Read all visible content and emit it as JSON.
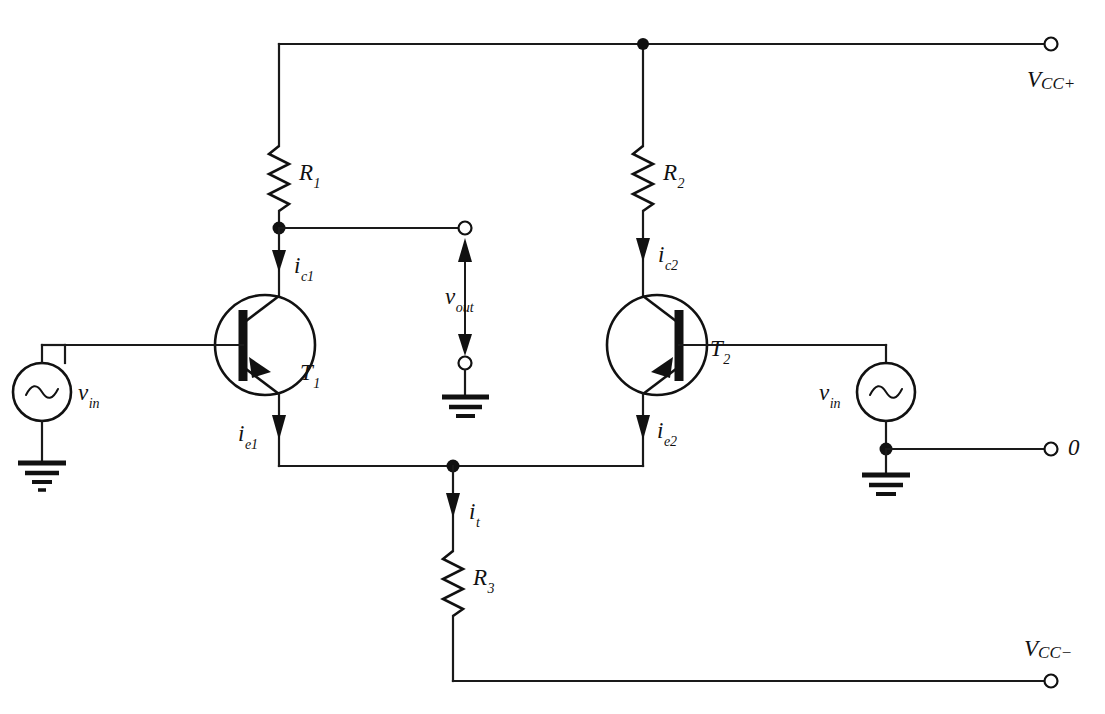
{
  "figure": {
    "type": "schematic",
    "background_color": "#ffffff",
    "line_color": "#111111"
  },
  "labels": {
    "r1": {
      "symbol": "R",
      "subscript": "1"
    },
    "r2": {
      "symbol": "R",
      "subscript": "2"
    },
    "r3": {
      "symbol": "R",
      "subscript": "3"
    },
    "t1": {
      "symbol": "T",
      "subscript": "1"
    },
    "t2": {
      "symbol": "T",
      "subscript": "2"
    },
    "ic1": {
      "symbol": "i",
      "subscript": "c1"
    },
    "ic2": {
      "symbol": "i",
      "subscript": "c2"
    },
    "ie1": {
      "symbol": "i",
      "subscript": "e1"
    },
    "ie2": {
      "symbol": "i",
      "subscript": "e2"
    },
    "it": {
      "symbol": "i",
      "subscript": "t"
    },
    "vin_left": {
      "symbol": "v",
      "subscript": "in"
    },
    "vin_right": {
      "symbol": "v",
      "subscript": "in"
    },
    "vout": {
      "symbol": "v",
      "subscript": "out"
    },
    "vcc_plus": {
      "symbol": "V",
      "subscript": "CC",
      "sign": "+"
    },
    "vcc_minus": {
      "symbol": "V",
      "subscript": "CC",
      "sign": "−"
    },
    "ref_zero": {
      "symbol": "0"
    }
  },
  "components": [
    {
      "name": "resistor-r1",
      "kind": "resistor",
      "label": "R1",
      "orientation": "vertical"
    },
    {
      "name": "resistor-r2",
      "kind": "resistor",
      "label": "R2",
      "orientation": "vertical"
    },
    {
      "name": "resistor-r3",
      "kind": "resistor",
      "label": "R3",
      "orientation": "vertical"
    },
    {
      "name": "transistor-t1",
      "kind": "bjt",
      "label": "T1",
      "facing": "right"
    },
    {
      "name": "transistor-t2",
      "kind": "bjt",
      "label": "T2",
      "facing": "left"
    },
    {
      "name": "source-vin-left",
      "kind": "ac-source",
      "label": "vin"
    },
    {
      "name": "source-vin-right",
      "kind": "ac-source",
      "label": "vin"
    },
    {
      "name": "ground-left",
      "kind": "ground"
    },
    {
      "name": "ground-right",
      "kind": "ground"
    },
    {
      "name": "ground-output",
      "kind": "ground"
    }
  ],
  "terminals": [
    {
      "name": "terminal-vcc-plus",
      "label": "VCC+"
    },
    {
      "name": "terminal-vcc-minus",
      "label": "VCC-"
    },
    {
      "name": "terminal-zero",
      "label": "0"
    },
    {
      "name": "terminal-vout-top",
      "label": ""
    },
    {
      "name": "terminal-vout-bottom",
      "label": ""
    }
  ],
  "currents": [
    {
      "name": "current-ic1",
      "label": "ic1",
      "direction": "down"
    },
    {
      "name": "current-ic2",
      "label": "ic2",
      "direction": "down"
    },
    {
      "name": "current-ie1",
      "label": "ie1",
      "direction": "down"
    },
    {
      "name": "current-ie2",
      "label": "ie2",
      "direction": "down"
    },
    {
      "name": "current-it",
      "label": "it",
      "direction": "down"
    }
  ]
}
